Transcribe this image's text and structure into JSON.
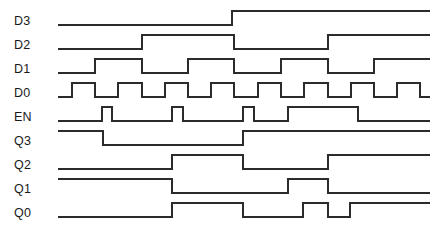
{
  "diagram": {
    "kind": "digital-timing-diagram",
    "title": "",
    "background_color": "#ffffff",
    "trace_color": "#2b2b2b",
    "label_color": "#1a1a1a",
    "trace_width": 1.4,
    "width": 444,
    "height": 236,
    "time_axis": {
      "start_x": 58,
      "end_x": 430,
      "unit_px": 23
    },
    "signals": [
      {
        "name": "D3",
        "label_x": 14,
        "label_y": 21,
        "high_y": 11,
        "low_y": 25,
        "initial_level": 0,
        "edges": [
          232
        ],
        "levels": [
          0,
          1
        ]
      },
      {
        "name": "D2",
        "label_x": 14,
        "label_y": 45,
        "high_y": 35,
        "low_y": 49,
        "initial_level": 0,
        "edges": [
          142,
          234,
          328
        ],
        "levels": [
          0,
          1,
          0,
          1
        ]
      },
      {
        "name": "D1",
        "label_x": 14,
        "label_y": 69,
        "high_y": 59,
        "low_y": 73,
        "initial_level": 0,
        "edges": [
          95,
          142,
          188,
          234,
          281,
          328,
          374
        ],
        "levels": [
          0,
          1,
          0,
          1,
          0,
          1,
          0,
          1
        ]
      },
      {
        "name": "D0",
        "label_x": 14,
        "label_y": 93,
        "high_y": 83,
        "low_y": 97,
        "initial_level": 0,
        "edges": [
          72,
          95,
          118,
          142,
          165,
          188,
          211,
          234,
          258,
          281,
          304,
          328,
          351,
          374,
          397,
          420
        ],
        "levels": [
          0,
          1,
          0,
          1,
          0,
          1,
          0,
          1,
          0,
          1,
          0,
          1,
          0,
          1,
          0,
          1,
          0
        ]
      },
      {
        "name": "EN",
        "label_x": 14,
        "label_y": 117,
        "high_y": 107,
        "low_y": 121,
        "initial_level": 0,
        "edges": [
          102,
          112,
          172,
          183,
          243,
          254,
          288,
          358
        ],
        "levels": [
          0,
          1,
          0,
          1,
          0,
          1,
          0,
          1,
          0
        ]
      },
      {
        "name": "Q3",
        "label_x": 14,
        "label_y": 141,
        "high_y": 131,
        "low_y": 145,
        "initial_level": 1,
        "edges": [
          103,
          243
        ],
        "levels": [
          1,
          0,
          1
        ]
      },
      {
        "name": "Q2",
        "label_x": 14,
        "label_y": 165,
        "high_y": 155,
        "low_y": 169,
        "initial_level": 0,
        "edges": [
          172,
          243,
          328
        ],
        "levels": [
          0,
          1,
          0,
          1
        ]
      },
      {
        "name": "Q1",
        "label_x": 14,
        "label_y": 189,
        "high_y": 179,
        "low_y": 193,
        "initial_level": 1,
        "edges": [
          172,
          288,
          328
        ],
        "levels": [
          1,
          0,
          1,
          0
        ]
      },
      {
        "name": "Q0",
        "label_x": 14,
        "label_y": 213,
        "high_y": 203,
        "low_y": 217,
        "initial_level": 0,
        "edges": [
          172,
          243,
          303,
          328,
          350
        ],
        "levels": [
          0,
          1,
          0,
          1,
          0,
          1
        ]
      }
    ]
  }
}
